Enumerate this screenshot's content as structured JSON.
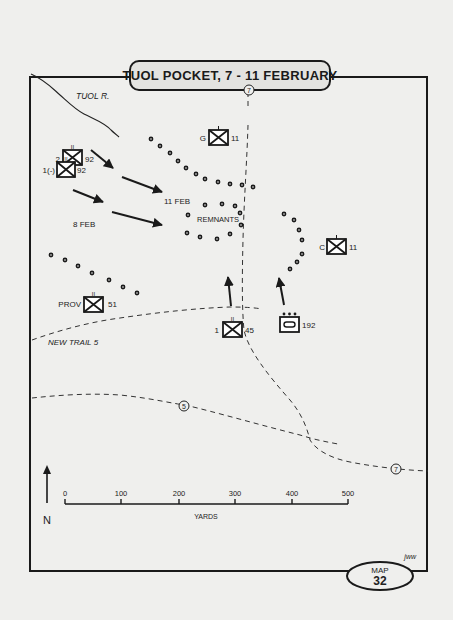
{
  "title": "TUOL POCKET, 7 - 11 FEBRUARY",
  "map_badge": {
    "label": "MAP",
    "number": "32"
  },
  "credit": "jww",
  "features": {
    "river": "TUOL R.",
    "trail": "NEW TRAIL 5",
    "route_markers": [
      "7",
      "5",
      "7"
    ]
  },
  "dates": {
    "first": "8 FEB",
    "second": "11 FEB"
  },
  "enemy_label": "REMNANTS",
  "units": [
    {
      "id": "u1",
      "left": "2",
      "right": "92",
      "echelon": "II",
      "type": "infantry"
    },
    {
      "id": "u2",
      "left": "1(-)",
      "right": "92",
      "echelon": "II",
      "type": "infantry"
    },
    {
      "id": "u3",
      "left": "G",
      "right": "11",
      "echelon": "I",
      "type": "infantry"
    },
    {
      "id": "u4",
      "left": "C",
      "right": "11",
      "echelon": "I",
      "type": "infantry"
    },
    {
      "id": "u5",
      "left": "PROV",
      "right": "51",
      "echelon": "II",
      "type": "infantry"
    },
    {
      "id": "u6",
      "left": "1",
      "right": "45",
      "echelon": "II",
      "type": "infantry"
    },
    {
      "id": "u7",
      "left": "",
      "right": "192",
      "echelon": "•••",
      "type": "armor"
    }
  ],
  "scale": {
    "ticks": [
      "0",
      "100",
      "200",
      "300",
      "400",
      "500"
    ],
    "unit": "YARDS"
  },
  "north": "N",
  "colors": {
    "ink": "#1a1a1a",
    "paper": "#efefed",
    "title_fill": "#e3e3e0"
  }
}
